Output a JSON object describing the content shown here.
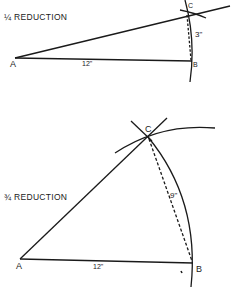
{
  "diagram1": {
    "title": "¼ REDUCTION",
    "points": {
      "A": "A",
      "B": "B",
      "C": "C"
    },
    "dimensions": {
      "AB": "12\"",
      "BC": "3\""
    }
  },
  "diagram2": {
    "title": "¾ REDUCTION",
    "points": {
      "A": "A",
      "B": "B",
      "C": "C"
    },
    "dimensions": {
      "AB": "12\"",
      "BC": "9\""
    }
  },
  "colors": {
    "ink": "#1a1a1a",
    "paper": "#ffffff"
  }
}
